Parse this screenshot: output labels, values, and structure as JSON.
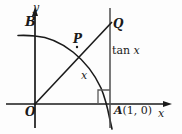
{
  "figure": {
    "type": "unit-circle-trigonometry-diagram",
    "labels": {
      "y_axis": "y",
      "x_axis": "x",
      "origin": "O",
      "point_b": "B",
      "point_p": "P",
      "point_q": "Q",
      "point_a": "A(1, 0)",
      "point_a_letter": "A",
      "point_a_coords": "(1, 0)",
      "angle": "x",
      "tangent_segment": "tan x",
      "tangent_word": "tan ",
      "tangent_var": "x"
    },
    "colors": {
      "stroke": "#1a1a1a",
      "background": "#fdfdfd",
      "tangent_line": "#555555"
    },
    "geometry": {
      "origin_px": [
        35,
        104
      ],
      "point_a_px": [
        110,
        104
      ],
      "point_b_px": [
        35,
        36
      ],
      "point_p_px": [
        77,
        47
      ],
      "point_q_px": [
        110,
        26
      ],
      "unit_radius_px": 75,
      "angle_degrees": 47
    }
  }
}
